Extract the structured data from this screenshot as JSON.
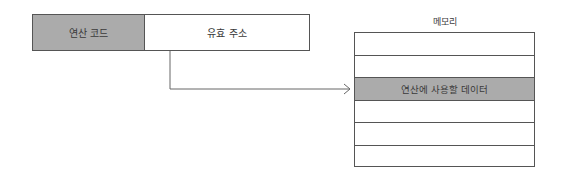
{
  "instruction": {
    "opcode_label": "연산 코드",
    "operand_label": "유효 주소"
  },
  "memory": {
    "title": "메모리",
    "rows": [
      {
        "label": "",
        "highlight": false
      },
      {
        "label": "",
        "highlight": false
      },
      {
        "label": "연산에 사용할 데이터",
        "highlight": true
      },
      {
        "label": "",
        "highlight": false
      },
      {
        "label": "",
        "highlight": false
      },
      {
        "label": "",
        "highlight": false
      }
    ]
  },
  "colors": {
    "highlight_fill": "#ababab",
    "border": "#555555"
  }
}
